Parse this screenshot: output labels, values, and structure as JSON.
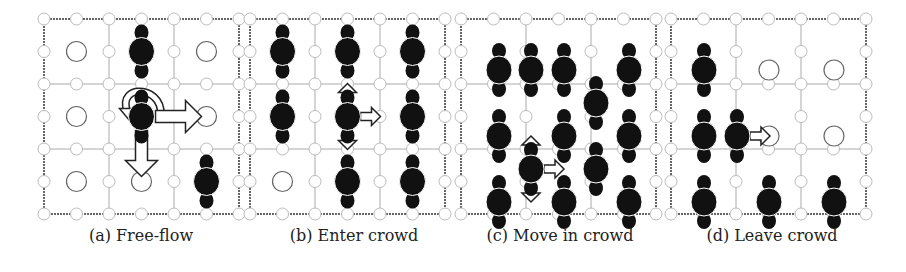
{
  "figure": {
    "panels": [
      {
        "id": "a",
        "caption": "(a) Free-flow",
        "x": 44,
        "y": 19,
        "persons": [
          [
            1,
            0
          ],
          [
            1,
            1
          ],
          [
            2,
            2
          ]
        ],
        "empty_cells": [
          [
            0,
            0
          ],
          [
            2,
            0
          ],
          [
            0,
            1
          ],
          [
            2,
            1
          ],
          [
            1,
            2
          ],
          [
            0,
            2
          ]
        ],
        "arrows": [
          {
            "type": "rotate",
            "cell": [
              1,
              1
            ]
          },
          {
            "type": "right",
            "from": [
              1,
              1
            ],
            "size": "large"
          },
          {
            "type": "down",
            "from": [
              1,
              1
            ],
            "size": "large"
          }
        ]
      },
      {
        "id": "b",
        "caption": "(b) Enter crowd",
        "x": 250,
        "y": 19,
        "persons": [
          [
            0,
            0
          ],
          [
            1,
            0
          ],
          [
            2,
            0
          ],
          [
            0,
            1
          ],
          [
            1,
            1
          ],
          [
            2,
            1
          ],
          [
            1,
            2
          ],
          [
            2,
            2
          ]
        ],
        "empty_cells": [
          [
            0,
            2
          ]
        ],
        "arrows": [
          {
            "type": "up",
            "from": [
              1,
              1
            ],
            "size": "small"
          },
          {
            "type": "right",
            "from": [
              1,
              1
            ],
            "size": "small"
          },
          {
            "type": "down",
            "from": [
              1,
              1
            ],
            "size": "small"
          }
        ]
      },
      {
        "id": "c",
        "caption": "(c) Move in crowd",
        "x": 461,
        "y": 19,
        "persons_free": [
          [
            38,
            51
          ],
          [
            70,
            51
          ],
          [
            103,
            51
          ],
          [
            168,
            51
          ],
          [
            135,
            84
          ],
          [
            38,
            117
          ],
          [
            103,
            117
          ],
          [
            168,
            117
          ],
          [
            70,
            150
          ],
          [
            135,
            150
          ],
          [
            38,
            183
          ],
          [
            103,
            183
          ],
          [
            168,
            183
          ]
        ],
        "arrows_free": [
          {
            "type": "up",
            "at": [
              70,
              150
            ]
          },
          {
            "type": "right",
            "at": [
              70,
              150
            ]
          },
          {
            "type": "down",
            "at": [
              70,
              150
            ]
          }
        ]
      },
      {
        "id": "d",
        "caption": "(d) Leave crowd",
        "x": 671,
        "y": 19,
        "persons_free": [
          [
            33,
            51
          ],
          [
            33,
            117
          ],
          [
            66,
            117
          ],
          [
            33,
            183
          ],
          [
            98,
            183
          ],
          [
            163,
            183
          ]
        ],
        "empty_cells_free": [
          [
            98,
            51
          ],
          [
            163,
            51
          ],
          [
            98,
            117
          ],
          [
            163,
            117
          ]
        ],
        "arrows_free": [
          {
            "type": "right",
            "at": [
              66,
              117
            ]
          }
        ]
      }
    ]
  }
}
